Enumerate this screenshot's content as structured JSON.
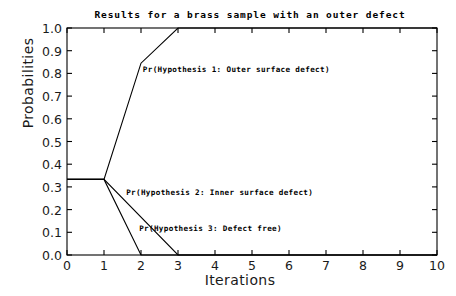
{
  "chart_data": {
    "type": "line",
    "title": "Results for a brass sample with an outer defect",
    "xlabel": "Iterations",
    "ylabel": "Probabilities",
    "xlim": [
      0,
      10
    ],
    "ylim": [
      0.0,
      1.0
    ],
    "xticks": [
      "0",
      "1",
      "2",
      "3",
      "4",
      "5",
      "6",
      "7",
      "8",
      "9",
      "10"
    ],
    "yticks": [
      "0.0",
      "0.1",
      "0.2",
      "0.3",
      "0.4",
      "0.5",
      "0.6",
      "0.7",
      "0.8",
      "0.9",
      "1.0"
    ],
    "grid": false,
    "legend_position": "inline-annotations",
    "line_color": "#000000",
    "frame_color": "#000000",
    "background": "#ffffff",
    "series": [
      {
        "name": "Pr(Hypothesis 1: Outer surface defect)",
        "x": [
          0,
          1,
          2,
          3,
          10
        ],
        "values": [
          0.333,
          0.333,
          0.845,
          1.0,
          1.0
        ],
        "annotation": "Pr(Hypothesis 1: Outer surface defect)"
      },
      {
        "name": "Pr(Hypothesis 2: Inner surface defect)",
        "x": [
          0,
          1,
          3,
          10
        ],
        "values": [
          0.333,
          0.333,
          0.0,
          0.0
        ],
        "annotation": "Pr(Hypothesis 2: Inner surface defect)"
      },
      {
        "name": "Pr(Hypothesis 3: Defect free)",
        "x": [
          0,
          1,
          2,
          10
        ],
        "values": [
          0.333,
          0.333,
          0.0,
          0.0
        ],
        "annotation": "Pr(Hypothesis 3: Defect free)"
      }
    ],
    "annotations": [
      {
        "text": "Pr(Hypothesis 1: Outer surface defect)",
        "x": 2.05,
        "y": 0.815
      },
      {
        "text": "Pr(Hypothesis 2: Inner surface defect)",
        "x": 1.6,
        "y": 0.275
      },
      {
        "text": "Pr(Hypothesis 3: Defect free)",
        "x": 1.95,
        "y": 0.115
      }
    ]
  }
}
